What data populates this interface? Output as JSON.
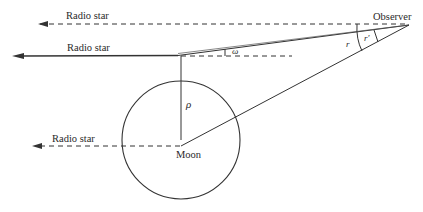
{
  "diagram": {
    "type": "geometry",
    "labels": {
      "top_ray": "Radio star",
      "grazing_ray": "Radio star",
      "moon_ray": "Radio star",
      "observer": "Observer",
      "moon": "Moon",
      "rho": "ρ",
      "omega": "ω",
      "r": "r",
      "r_prime": "r′"
    },
    "colors": {
      "line": "#333333",
      "background": "#ffffff"
    },
    "points": {
      "observer": [
        409,
        25
      ],
      "moon_center": [
        181,
        140
      ],
      "limb_tangent": [
        181,
        56
      ]
    },
    "moon_radius_px": 59
  }
}
